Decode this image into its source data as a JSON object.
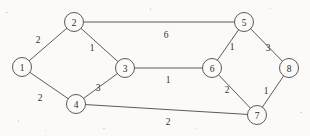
{
  "figure": {
    "kind": "weighted-undirected-graph",
    "background_color": "#fbfaf8",
    "stroke_color": "#4a4846",
    "text_color": "#2e2c2a",
    "width": 310,
    "height": 136
  },
  "nodes": [
    {
      "id": "1",
      "label": "1",
      "cx": 22,
      "cy": 67,
      "r": 9.5
    },
    {
      "id": "2",
      "label": "2",
      "cx": 74,
      "cy": 22,
      "r": 9.5
    },
    {
      "id": "3",
      "label": "3",
      "cx": 125,
      "cy": 68,
      "r": 9.5
    },
    {
      "id": "4",
      "label": "4",
      "cx": 76,
      "cy": 104,
      "r": 9.5
    },
    {
      "id": "5",
      "label": "5",
      "cx": 244,
      "cy": 22,
      "r": 9.5
    },
    {
      "id": "6",
      "label": "6",
      "cx": 212,
      "cy": 68,
      "r": 9.5
    },
    {
      "id": "7",
      "label": "7",
      "cx": 257,
      "cy": 115,
      "r": 9.5
    },
    {
      "id": "8",
      "label": "8",
      "cx": 289,
      "cy": 68,
      "r": 9.5
    }
  ],
  "edges": [
    {
      "id": "e1-2",
      "source": "1",
      "target": "2",
      "weight": "2",
      "lx": 38,
      "ly": 40
    },
    {
      "id": "e1-4",
      "source": "1",
      "target": "4",
      "weight": "2",
      "lx": 40,
      "ly": 98
    },
    {
      "id": "e2-3",
      "source": "2",
      "target": "3",
      "weight": "1",
      "lx": 92,
      "ly": 48
    },
    {
      "id": "e2-5",
      "source": "2",
      "target": "5",
      "weight": "6",
      "lx": 166,
      "ly": 35
    },
    {
      "id": "e3-4",
      "source": "3",
      "target": "4",
      "weight": "3",
      "lx": 98,
      "ly": 88
    },
    {
      "id": "e3-6",
      "source": "3",
      "target": "6",
      "weight": "1",
      "lx": 168,
      "ly": 80
    },
    {
      "id": "e4-7",
      "source": "4",
      "target": "7",
      "weight": "2",
      "lx": 168,
      "ly": 122
    },
    {
      "id": "e5-6",
      "source": "5",
      "target": "6",
      "weight": "1",
      "lx": 232,
      "ly": 47
    },
    {
      "id": "e5-8",
      "source": "5",
      "target": "8",
      "weight": "3",
      "lx": 268,
      "ly": 48
    },
    {
      "id": "e6-7",
      "source": "6",
      "target": "7",
      "weight": "2",
      "lx": 227,
      "ly": 90
    },
    {
      "id": "e7-8",
      "source": "7",
      "target": "8",
      "weight": "1",
      "lx": 266,
      "ly": 91
    }
  ],
  "speckles": [
    {
      "x": 6,
      "y": 12,
      "w": 2,
      "h": 1
    },
    {
      "x": 150,
      "y": 8,
      "w": 1,
      "h": 2
    },
    {
      "x": 103,
      "y": 128,
      "w": 2,
      "h": 1
    },
    {
      "x": 196,
      "y": 128,
      "w": 1,
      "h": 1
    },
    {
      "x": 300,
      "y": 112,
      "w": 2,
      "h": 1
    },
    {
      "x": 45,
      "y": 130,
      "w": 1,
      "h": 1
    },
    {
      "x": 270,
      "y": 8,
      "w": 1,
      "h": 1
    },
    {
      "x": 18,
      "y": 120,
      "w": 1,
      "h": 2
    }
  ]
}
